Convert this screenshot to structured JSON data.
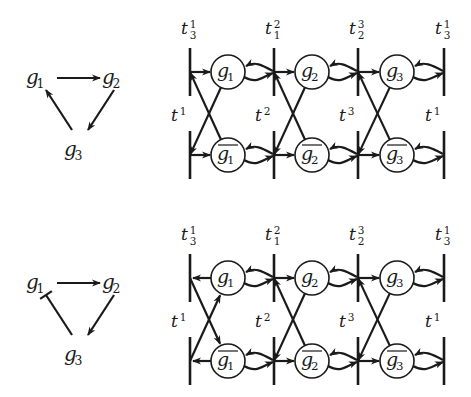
{
  "colors": {
    "ink": "#1a1a1a",
    "background": "#ffffff"
  },
  "panels": [
    {
      "id": "top",
      "graph": {
        "nodes": [
          {
            "id": "g1",
            "base": "g",
            "sub": "1",
            "x": 42,
            "y": 78
          },
          {
            "id": "g2",
            "base": "g",
            "sub": "2",
            "x": 118,
            "y": 78
          },
          {
            "id": "g3",
            "base": "g",
            "sub": "3",
            "x": 80,
            "y": 150
          }
        ],
        "edges": [
          {
            "from": "g1",
            "to": "g2",
            "type": "activation"
          },
          {
            "from": "g2",
            "to": "g3",
            "type": "activation"
          },
          {
            "from": "g3",
            "to": "g1",
            "type": "activation"
          }
        ]
      },
      "network": {
        "row_top_y": 72,
        "row_bottom_y": 155,
        "bar_x": [
          190,
          274,
          358,
          444
        ],
        "top_labels": [
          {
            "base": "t",
            "sup": "1",
            "sub": "3"
          },
          {
            "base": "t",
            "sup": "2",
            "sub": "1"
          },
          {
            "base": "t",
            "sup": "3",
            "sub": "2"
          },
          {
            "base": "t",
            "sup": "1",
            "sub": "3"
          }
        ],
        "bottom_labels": [
          {
            "base": "t",
            "sup": "1"
          },
          {
            "base": "t",
            "sup": "2"
          },
          {
            "base": "t",
            "sup": "3"
          },
          {
            "base": "t",
            "sup": "1"
          }
        ],
        "places_top": [
          {
            "base": "g",
            "sub": "1",
            "negated": false
          },
          {
            "base": "g",
            "sub": "2",
            "negated": false
          },
          {
            "base": "g",
            "sub": "3",
            "negated": false
          }
        ],
        "places_bottom": [
          {
            "base": "g",
            "sub": "1",
            "negated": true
          },
          {
            "base": "g",
            "sub": "2",
            "negated": true
          },
          {
            "base": "g",
            "sub": "3",
            "negated": true
          }
        ],
        "first_link_direction": "into-place"
      }
    },
    {
      "id": "bottom",
      "graph": {
        "nodes": [
          {
            "id": "g1",
            "base": "g",
            "sub": "1",
            "x": 42,
            "y": 283
          },
          {
            "id": "g2",
            "base": "g",
            "sub": "2",
            "x": 118,
            "y": 283
          },
          {
            "id": "g3",
            "base": "g",
            "sub": "3",
            "x": 80,
            "y": 355
          }
        ],
        "edges": [
          {
            "from": "g1",
            "to": "g2",
            "type": "activation"
          },
          {
            "from": "g2",
            "to": "g3",
            "type": "activation"
          },
          {
            "from": "g3",
            "to": "g1",
            "type": "inhibition"
          }
        ]
      },
      "network": {
        "row_top_y": 278,
        "row_bottom_y": 361,
        "bar_x": [
          190,
          274,
          358,
          444
        ],
        "top_labels": [
          {
            "base": "t",
            "sup": "1",
            "sub": "3"
          },
          {
            "base": "t",
            "sup": "2",
            "sub": "1"
          },
          {
            "base": "t",
            "sup": "3",
            "sub": "2"
          },
          {
            "base": "t",
            "sup": "1",
            "sub": "3"
          }
        ],
        "bottom_labels": [
          {
            "base": "t",
            "sup": "1"
          },
          {
            "base": "t",
            "sup": "2"
          },
          {
            "base": "t",
            "sup": "3"
          },
          {
            "base": "t",
            "sup": "1"
          }
        ],
        "places_top": [
          {
            "base": "g",
            "sub": "1",
            "negated": false
          },
          {
            "base": "g",
            "sub": "2",
            "negated": false
          },
          {
            "base": "g",
            "sub": "3",
            "negated": false
          }
        ],
        "places_bottom": [
          {
            "base": "g",
            "sub": "1",
            "negated": true
          },
          {
            "base": "g",
            "sub": "2",
            "negated": true
          },
          {
            "base": "g",
            "sub": "3",
            "negated": true
          }
        ],
        "first_link_direction": "out-of-place"
      }
    }
  ]
}
